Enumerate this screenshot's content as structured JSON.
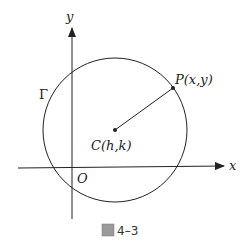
{
  "diagram": {
    "type": "coordinate-geometry",
    "axes": {
      "x_label": "x",
      "y_label": "y",
      "origin_label": "O"
    },
    "circle": {
      "label": "Γ",
      "center_label": "C(h,k)",
      "center_px": [
        115,
        130
      ],
      "radius_px": 72
    },
    "point": {
      "label": "P(x,y)",
      "position_px": [
        173,
        88
      ]
    },
    "caption": {
      "figure_mark": "圖",
      "number": "4–3"
    },
    "colors": {
      "stroke": "#222222",
      "background": "#ffffff",
      "caption_box": "#9a9a9a"
    }
  }
}
